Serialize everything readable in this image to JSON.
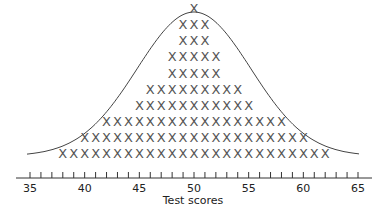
{
  "chart_data": {
    "type": "dot_plot",
    "title": "",
    "xlabel": "Test scores",
    "ylabel": "",
    "marker": "X",
    "x_axis": {
      "min": 35,
      "max": 65,
      "minor_tick_step": 1,
      "tick_labels": [
        "35",
        "40",
        "45",
        "50",
        "55",
        "60",
        "65"
      ]
    },
    "grid": false,
    "legend": null,
    "x": [
      38,
      39,
      40,
      41,
      42,
      43,
      44,
      45,
      46,
      47,
      48,
      49,
      50,
      51,
      52,
      53,
      54,
      55,
      56,
      57,
      58,
      59,
      60,
      61,
      62
    ],
    "values": [
      1,
      1,
      2,
      2,
      3,
      3,
      3,
      4,
      5,
      5,
      7,
      9,
      10,
      9,
      7,
      5,
      5,
      4,
      3,
      3,
      3,
      2,
      2,
      1,
      1
    ],
    "rows_top_to_bottom": [
      {
        "count": 1,
        "from": 50,
        "to": 50
      },
      {
        "count": 3,
        "from": 49,
        "to": 51
      },
      {
        "count": 3,
        "from": 49,
        "to": 51
      },
      {
        "count": 5,
        "from": 48,
        "to": 52
      },
      {
        "count": 5,
        "from": 48,
        "to": 52
      },
      {
        "count": 9,
        "from": 46,
        "to": 54
      },
      {
        "count": 11,
        "from": 45,
        "to": 55
      },
      {
        "count": 17,
        "from": 42,
        "to": 58
      },
      {
        "count": 21,
        "from": 40,
        "to": 60
      },
      {
        "count": 25,
        "from": 38,
        "to": 62
      }
    ],
    "total_marks": 100,
    "overlay": "normal (bell) curve centered at 50",
    "colors": {
      "marker": "#555555",
      "curve": "#444444",
      "axis": "#333333"
    }
  }
}
